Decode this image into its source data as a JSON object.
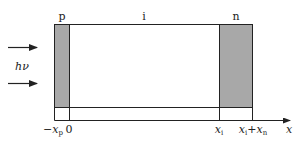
{
  "diagram": {
    "type": "p-i-n photodiode structure",
    "region_labels": {
      "p": "p",
      "i": "i",
      "n": "n"
    },
    "light_label": {
      "main": "h",
      "nu": "ν"
    },
    "axis_labels": {
      "neg_xp_sign": "−",
      "neg_xp_main": "x",
      "neg_xp_sub": "p",
      "zero": "0",
      "xi_main": "x",
      "xi_sub": "i",
      "xixn_main1": "x",
      "xixn_sub1": "i",
      "xixn_plus": "+",
      "xixn_main2": "x",
      "xixn_sub2": "n",
      "axis": "x"
    },
    "colors": {
      "doped_fill": "#a8a8a8",
      "line": "#222222"
    }
  }
}
